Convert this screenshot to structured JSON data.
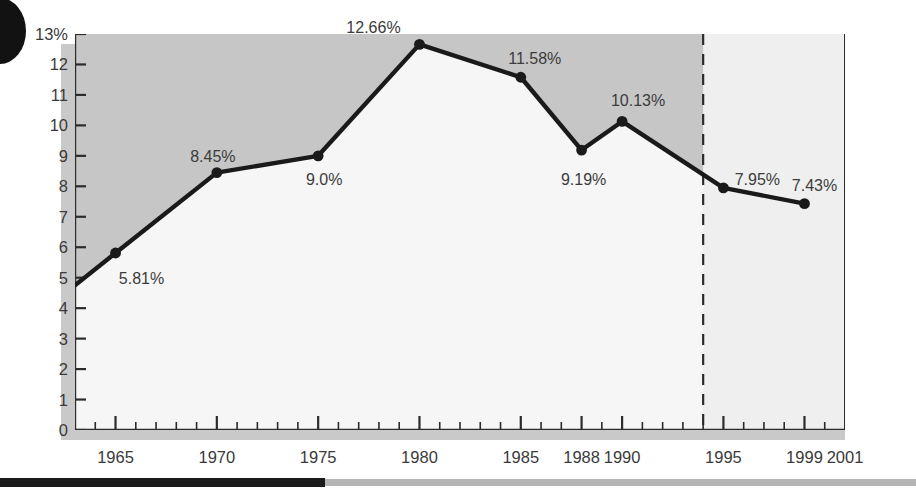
{
  "chart_data": {
    "type": "line",
    "title": "",
    "xlabel": "",
    "ylabel": "",
    "x": [
      1965,
      1970,
      1975,
      1980,
      1985,
      1988,
      1990,
      1995,
      1999
    ],
    "values": [
      5.81,
      8.45,
      9.0,
      12.66,
      11.58,
      9.19,
      10.13,
      7.95,
      7.43
    ],
    "point_labels": [
      "5.81%",
      "8.45%",
      "9.0%",
      "12.66%",
      "11.58%",
      "9.19%",
      "10.13%",
      "7.95%",
      "7.43%"
    ],
    "xlim": [
      1963,
      2001
    ],
    "ylim": [
      0,
      13
    ],
    "x_tick_labels": [
      "1965",
      "1970",
      "1975",
      "1980",
      "1985",
      "1988",
      "1990",
      "1995",
      "1999",
      "2001"
    ],
    "x_tick_values": [
      1965,
      1970,
      1975,
      1980,
      1985,
      1988,
      1990,
      1995,
      1999,
      2001
    ],
    "x_minor_tick_step": 1,
    "y_tick_labels": [
      "13%",
      "12",
      "11",
      "10",
      "9",
      "8",
      "7",
      "6",
      "5",
      "4",
      "3",
      "2",
      "1",
      "0"
    ],
    "y_tick_values": [
      13,
      12,
      11,
      10,
      9,
      8,
      7,
      6,
      5,
      4,
      3,
      2,
      1,
      0
    ],
    "grid": false,
    "legend": null,
    "annotations": [
      {
        "name": "forecast-divider",
        "type": "vertical-dashed-line",
        "x": 1994
      }
    ],
    "fill_above_line": {
      "name": "shaded-region-above-line",
      "x_from": 1963,
      "x_to": 1994,
      "color": "#c6c6c6"
    },
    "colors": {
      "line": "#1a1a1a",
      "marker": "#1a1a1a",
      "plot_background": "#f6f6f6",
      "shade_above_line": "#c6c6c6",
      "shade_right_panel": "#efefef",
      "axis": "#2b2b2b",
      "drop_shadow": "#c9c9c9",
      "tick_label": "#3a3a3a",
      "rule_dark": "#1b1b1b",
      "rule_light": "#b4b4b4"
    }
  },
  "decorations": {
    "corner_blob": "black-ellipse-decoration",
    "bottom_rule_dark_width_px": 325
  }
}
